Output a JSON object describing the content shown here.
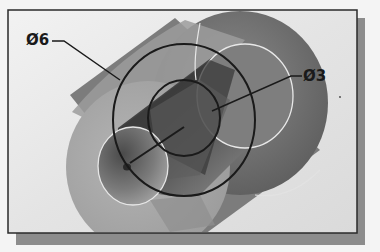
{
  "figure": {
    "type": "3d-cylinder-section-view",
    "annotations": [
      {
        "id": "outer-diameter",
        "label": "Ø6"
      },
      {
        "id": "inner-diameter",
        "label": "Ø3"
      }
    ]
  },
  "colors": {
    "background": "#f4f4f4",
    "frame_fill": "#e2e2e2",
    "frame_border": "#2a2a2a",
    "frame_shadow": "#8a8a8a",
    "back_face": "#6e6e6e",
    "front_face": "#a9a9a9",
    "bore_dark": "#3c3c3c",
    "bore_light": "#8c8c8c",
    "leader_line": "#1a1a1a",
    "edge_highlight": "#e6e6e6"
  }
}
